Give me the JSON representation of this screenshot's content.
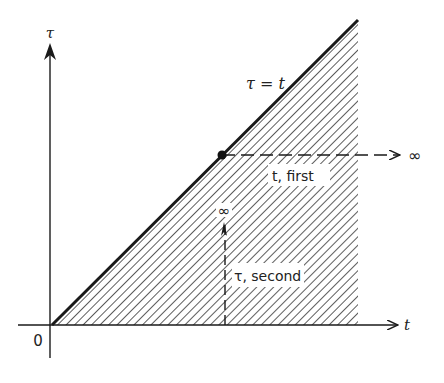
{
  "diagram": {
    "axes": {
      "x_label": "t",
      "y_label": "τ",
      "origin_label": "0"
    },
    "diagonal_label": "τ = t",
    "first_integration": {
      "label": "t, first",
      "direction": "horizontal",
      "limit_label": "∞"
    },
    "second_integration": {
      "label": "τ, second",
      "direction": "vertical",
      "limit_label": "∞"
    },
    "region": {
      "description": "shaded triangle between τ = 0 and τ = t",
      "hatch_color": "#333333"
    },
    "colors": {
      "line": "#1a1a1a",
      "hatch": "#333333",
      "background": "#ffffff"
    }
  }
}
